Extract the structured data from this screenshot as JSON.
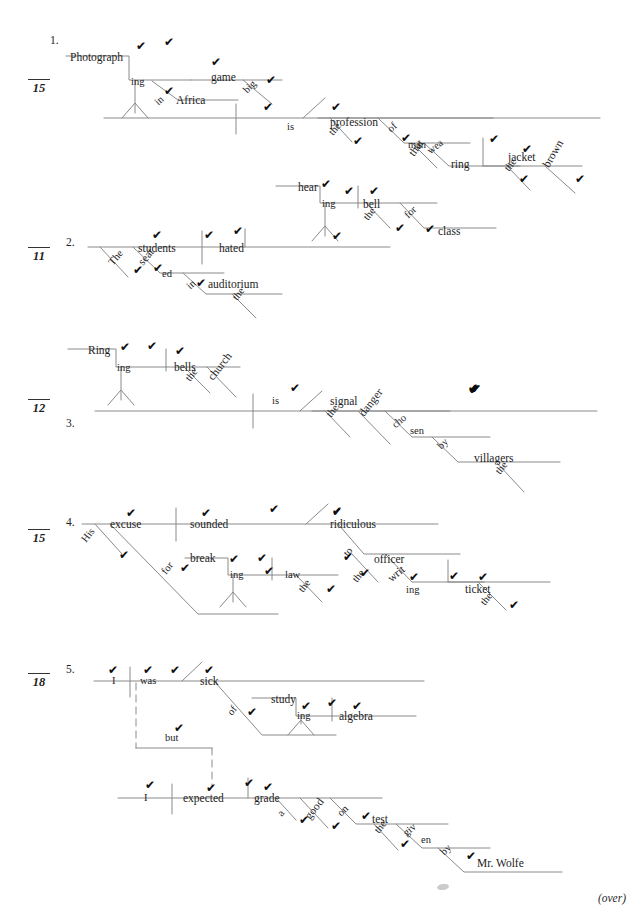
{
  "page": {
    "footer_note": "(over)",
    "width": 640,
    "height": 918,
    "line_color": "#8a8a8a",
    "text_color": "#1d1d1d",
    "check_mark": "✔"
  },
  "exercises": [
    {
      "number": "1.",
      "score": "15",
      "words": [
        {
          "text": "Photograph",
          "x": 70,
          "y": 52,
          "rot": 0
        },
        {
          "text": "ing",
          "x": 131,
          "y": 77,
          "rot": 0
        },
        {
          "text": "game",
          "x": 211,
          "y": 72,
          "rot": 0
        },
        {
          "text": "in",
          "x": 160,
          "y": 97,
          "rot": -42
        },
        {
          "text": "Africa",
          "x": 176,
          "y": 95,
          "rot": 0
        },
        {
          "text": "big",
          "x": 249,
          "y": 85,
          "rot": -46
        },
        {
          "text": "is",
          "x": 287,
          "y": 122,
          "rot": 0
        },
        {
          "text": "profession",
          "x": 330,
          "y": 117,
          "rot": 0
        },
        {
          "text": "the",
          "x": 335,
          "y": 127,
          "rot": -50
        },
        {
          "text": "of",
          "x": 393,
          "y": 124,
          "rot": -44
        },
        {
          "text": "man",
          "x": 408,
          "y": 140,
          "rot": 0
        },
        {
          "text": "that",
          "x": 416,
          "y": 147,
          "rot": -54
        },
        {
          "text": "wea",
          "x": 432,
          "y": 146,
          "rot": -38
        },
        {
          "text": "ring",
          "x": 451,
          "y": 159,
          "rot": 0
        },
        {
          "text": "jacket",
          "x": 508,
          "y": 152,
          "rot": 0
        },
        {
          "text": "the",
          "x": 511,
          "y": 163,
          "rot": -52
        },
        {
          "text": "brown",
          "x": 551,
          "y": 158,
          "rot": -60
        }
      ],
      "checks": [
        {
          "x": 136,
          "y": 40
        },
        {
          "x": 164,
          "y": 36
        },
        {
          "x": 211,
          "y": 56
        },
        {
          "x": 164,
          "y": 85
        },
        {
          "x": 266,
          "y": 74
        },
        {
          "x": 263,
          "y": 101
        },
        {
          "x": 331,
          "y": 101
        },
        {
          "x": 353,
          "y": 135
        },
        {
          "x": 401,
          "y": 132
        },
        {
          "x": 489,
          "y": 133
        },
        {
          "x": 522,
          "y": 143
        },
        {
          "x": 519,
          "y": 173
        },
        {
          "x": 575,
          "y": 173
        }
      ]
    },
    {
      "number": "2.",
      "score": "11",
      "words": [
        {
          "text": "hear",
          "x": 298,
          "y": 182,
          "rot": 0
        },
        {
          "text": "ing",
          "x": 322,
          "y": 199,
          "rot": 0
        },
        {
          "text": "bell",
          "x": 363,
          "y": 199,
          "rot": 0
        },
        {
          "text": "the",
          "x": 370,
          "y": 212,
          "rot": -52
        },
        {
          "text": "for",
          "x": 410,
          "y": 210,
          "rot": -44
        },
        {
          "text": "class",
          "x": 438,
          "y": 226,
          "rot": 0
        },
        {
          "text": "students",
          "x": 138,
          "y": 243,
          "rot": 0
        },
        {
          "text": "hated",
          "x": 219,
          "y": 243,
          "rot": 0
        },
        {
          "text": "The",
          "x": 115,
          "y": 257,
          "rot": -50
        },
        {
          "text": "seat",
          "x": 145,
          "y": 256,
          "rot": -50
        },
        {
          "text": "ed",
          "x": 162,
          "y": 269,
          "rot": 0
        },
        {
          "text": "in",
          "x": 192,
          "y": 281,
          "rot": -42
        },
        {
          "text": "auditorium",
          "x": 208,
          "y": 279,
          "rot": 0
        },
        {
          "text": "the",
          "x": 239,
          "y": 292,
          "rot": -52
        }
      ],
      "checks": [
        {
          "x": 321,
          "y": 178
        },
        {
          "x": 332,
          "y": 230
        },
        {
          "x": 344,
          "y": 185
        },
        {
          "x": 369,
          "y": 185
        },
        {
          "x": 395,
          "y": 222
        },
        {
          "x": 425,
          "y": 223
        },
        {
          "x": 152,
          "y": 229
        },
        {
          "x": 204,
          "y": 229
        },
        {
          "x": 233,
          "y": 225
        },
        {
          "x": 133,
          "y": 264
        },
        {
          "x": 153,
          "y": 262
        },
        {
          "x": 196,
          "y": 277
        }
      ]
    },
    {
      "number": "3.",
      "score": "12",
      "words": [
        {
          "text": "Ring",
          "x": 88,
          "y": 345,
          "rot": 0
        },
        {
          "text": "ing",
          "x": 117,
          "y": 363,
          "rot": 0
        },
        {
          "text": "bells",
          "x": 174,
          "y": 362,
          "rot": 0
        },
        {
          "text": "the",
          "x": 192,
          "y": 373,
          "rot": -52
        },
        {
          "text": "church",
          "x": 215,
          "y": 371,
          "rot": -52
        },
        {
          "text": "is",
          "x": 272,
          "y": 396,
          "rot": 0
        },
        {
          "text": "signal",
          "x": 330,
          "y": 396,
          "rot": 0
        },
        {
          "text": "the",
          "x": 333,
          "y": 409,
          "rot": -52
        },
        {
          "text": "danger",
          "x": 366,
          "y": 407,
          "rot": -52
        },
        {
          "text": "cho",
          "x": 397,
          "y": 420,
          "rot": -40
        },
        {
          "text": "sen",
          "x": 410,
          "y": 426,
          "rot": 0
        },
        {
          "text": "by",
          "x": 443,
          "y": 441,
          "rot": -44
        },
        {
          "text": "villagers",
          "x": 474,
          "y": 453,
          "rot": 0
        },
        {
          "text": "the",
          "x": 502,
          "y": 466,
          "rot": -52
        }
      ],
      "checks": [
        {
          "x": 120,
          "y": 341
        },
        {
          "x": 147,
          "y": 340
        },
        {
          "x": 175,
          "y": 345
        },
        {
          "x": 468,
          "y": 382
        },
        {
          "x": 290,
          "y": 382
        },
        {
          "x": 471,
          "y": 383
        },
        {
          "x": 469,
          "y": 384
        },
        {
          "x": 471,
          "y": 383
        },
        {
          "x": 468,
          "y": 383
        },
        {
          "x": 469,
          "y": 384
        },
        {
          "x": 469,
          "y": 383
        },
        {
          "x": 470,
          "y": 383
        }
      ]
    },
    {
      "number": "4.",
      "score": "15",
      "words": [
        {
          "text": "excuse",
          "x": 110,
          "y": 519,
          "rot": 0
        },
        {
          "text": "sounded",
          "x": 190,
          "y": 519,
          "rot": 0
        },
        {
          "text": "ridiculous",
          "x": 330,
          "y": 519,
          "rot": 0
        },
        {
          "text": "His",
          "x": 88,
          "y": 534,
          "rot": -52
        },
        {
          "text": "for",
          "x": 168,
          "y": 566,
          "rot": -52
        },
        {
          "text": "break",
          "x": 190,
          "y": 553,
          "rot": 0
        },
        {
          "text": "ing",
          "x": 230,
          "y": 570,
          "rot": 0
        },
        {
          "text": "law",
          "x": 285,
          "y": 570,
          "rot": 0
        },
        {
          "text": "the",
          "x": 305,
          "y": 584,
          "rot": -52
        },
        {
          "text": "to",
          "x": 350,
          "y": 548,
          "rot": -52
        },
        {
          "text": "officer",
          "x": 374,
          "y": 554,
          "rot": 0
        },
        {
          "text": "the",
          "x": 359,
          "y": 574,
          "rot": -52
        },
        {
          "text": "writ",
          "x": 393,
          "y": 573,
          "rot": -40
        },
        {
          "text": "ing",
          "x": 406,
          "y": 585,
          "rot": 0
        },
        {
          "text": "ticket",
          "x": 465,
          "y": 584,
          "rot": 0
        },
        {
          "text": "the",
          "x": 487,
          "y": 597,
          "rot": -52
        }
      ],
      "checks": [
        {
          "x": 126,
          "y": 507
        },
        {
          "x": 201,
          "y": 507
        },
        {
          "x": 332,
          "y": 505
        },
        {
          "x": 269,
          "y": 503
        },
        {
          "x": 119,
          "y": 549
        },
        {
          "x": 180,
          "y": 562
        },
        {
          "x": 229,
          "y": 553
        },
        {
          "x": 257,
          "y": 552
        },
        {
          "x": 264,
          "y": 565
        },
        {
          "x": 326,
          "y": 583
        },
        {
          "x": 343,
          "y": 551
        },
        {
          "x": 360,
          "y": 567
        },
        {
          "x": 409,
          "y": 571
        },
        {
          "x": 449,
          "y": 570
        },
        {
          "x": 478,
          "y": 571
        },
        {
          "x": 509,
          "y": 599
        },
        {
          "x": 332,
          "y": 506
        }
      ]
    },
    {
      "number": "5.",
      "score": "18",
      "words": [
        {
          "text": "I",
          "x": 112,
          "y": 676,
          "rot": 0
        },
        {
          "text": "was",
          "x": 140,
          "y": 676,
          "rot": 0
        },
        {
          "text": "sick",
          "x": 200,
          "y": 676,
          "rot": 0
        },
        {
          "text": "of",
          "x": 234,
          "y": 707,
          "rot": -52
        },
        {
          "text": "study",
          "x": 271,
          "y": 694,
          "rot": 0
        },
        {
          "text": "ing",
          "x": 297,
          "y": 711,
          "rot": 0
        },
        {
          "text": "algebra",
          "x": 339,
          "y": 711,
          "rot": 0
        },
        {
          "text": "but",
          "x": 165,
          "y": 733,
          "rot": 0
        },
        {
          "text": "I",
          "x": 144,
          "y": 793,
          "rot": 0
        },
        {
          "text": "expected",
          "x": 183,
          "y": 793,
          "rot": 0
        },
        {
          "text": "grade",
          "x": 254,
          "y": 793,
          "rot": 0
        },
        {
          "text": "a",
          "x": 284,
          "y": 808,
          "rot": -52
        },
        {
          "text": "good",
          "x": 312,
          "y": 810,
          "rot": -52
        },
        {
          "text": "on",
          "x": 343,
          "y": 808,
          "rot": -44
        },
        {
          "text": "test",
          "x": 372,
          "y": 814,
          "rot": 0
        },
        {
          "text": "the",
          "x": 381,
          "y": 825,
          "rot": -52
        },
        {
          "text": "giv",
          "x": 408,
          "y": 828,
          "rot": -40
        },
        {
          "text": "en",
          "x": 421,
          "y": 835,
          "rot": 0
        },
        {
          "text": "by",
          "x": 446,
          "y": 847,
          "rot": -44
        },
        {
          "text": "Mr. Wolfe",
          "x": 477,
          "y": 858,
          "rot": 0
        }
      ],
      "checks": [
        {
          "x": 108,
          "y": 664
        },
        {
          "x": 143,
          "y": 664
        },
        {
          "x": 170,
          "y": 664
        },
        {
          "x": 204,
          "y": 664
        },
        {
          "x": 247,
          "y": 706
        },
        {
          "x": 301,
          "y": 700
        },
        {
          "x": 327,
          "y": 697
        },
        {
          "x": 352,
          "y": 700
        },
        {
          "x": 174,
          "y": 722
        },
        {
          "x": 145,
          "y": 779
        },
        {
          "x": 206,
          "y": 782
        },
        {
          "x": 244,
          "y": 777
        },
        {
          "x": 263,
          "y": 781
        },
        {
          "x": 299,
          "y": 814
        },
        {
          "x": 331,
          "y": 820
        },
        {
          "x": 361,
          "y": 810
        },
        {
          "x": 400,
          "y": 838
        },
        {
          "x": 466,
          "y": 850
        }
      ]
    }
  ]
}
